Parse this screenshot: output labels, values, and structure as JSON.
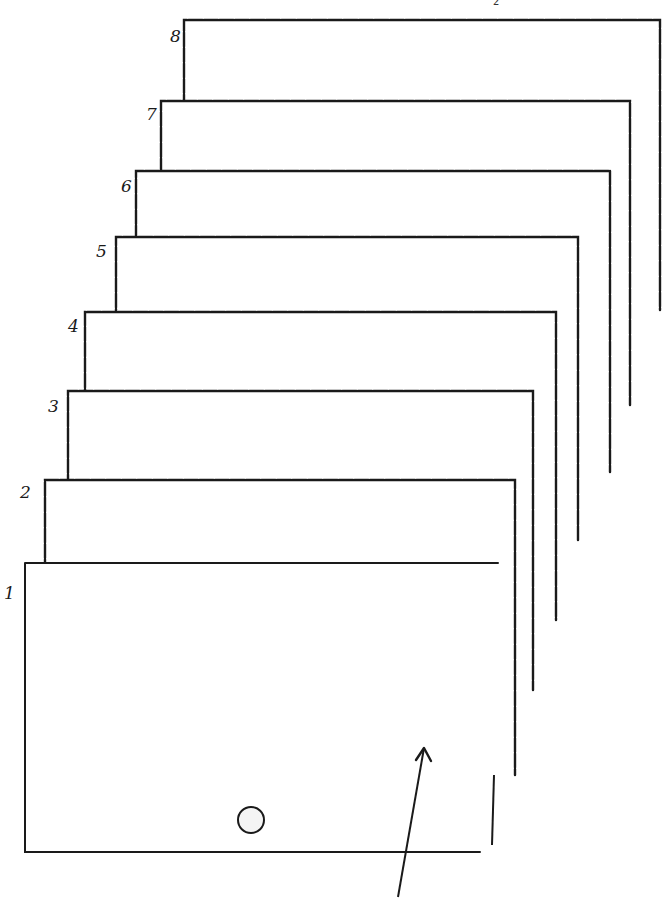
{
  "diagram": {
    "type": "stacked-sheets",
    "page_number": "2",
    "ink_color": "#1a1a1a",
    "sheets": [
      {
        "label": "1",
        "left": 25,
        "top": 563,
        "right": 498,
        "bottom": 852,
        "label_x": 4,
        "label_y": 585
      },
      {
        "label": "2",
        "left": 45,
        "top": 480,
        "right": 515,
        "bottom": 775,
        "label_x": 20,
        "label_y": 484
      },
      {
        "label": "3",
        "left": 68,
        "top": 391,
        "right": 533,
        "bottom": 690,
        "label_x": 48,
        "label_y": 398
      },
      {
        "label": "4",
        "left": 85,
        "top": 312,
        "right": 556,
        "bottom": 620,
        "label_x": 68,
        "label_y": 318
      },
      {
        "label": "5",
        "left": 116,
        "top": 237,
        "right": 578,
        "bottom": 540,
        "label_x": 96,
        "label_y": 243
      },
      {
        "label": "6",
        "left": 136,
        "top": 171,
        "right": 610,
        "bottom": 472,
        "label_x": 121,
        "label_y": 178
      },
      {
        "label": "7",
        "left": 161,
        "top": 101,
        "right": 630,
        "bottom": 405,
        "label_x": 146,
        "label_y": 106
      },
      {
        "label": "8",
        "left": 184,
        "top": 20,
        "right": 660,
        "bottom": 310,
        "label_x": 170,
        "label_y": 28
      }
    ],
    "hole": {
      "cx": 251,
      "cy": 820,
      "r": 13,
      "on_sheet": "1"
    },
    "arrow": {
      "x1": 398,
      "y1": 897,
      "x2": 424,
      "y2": 748,
      "points_to_sheet": "1"
    }
  }
}
